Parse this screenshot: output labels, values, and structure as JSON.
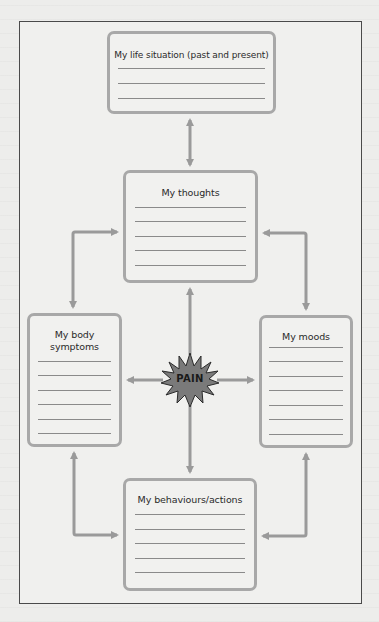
{
  "diagram": {
    "type": "cognitive-behavioural cycle diagram",
    "center": {
      "label": "PAIN",
      "icon": "starburst-icon"
    },
    "boxes": [
      {
        "id": "life-situation",
        "title": "My life situation (past and present)",
        "lines": 3
      },
      {
        "id": "thoughts",
        "title": "My thoughts",
        "lines": 5
      },
      {
        "id": "body-symptoms",
        "title": "My body symptoms",
        "lines": 6
      },
      {
        "id": "moods",
        "title": "My moods",
        "lines": 7
      },
      {
        "id": "behaviours",
        "title": "My behaviours/actions",
        "lines": 5
      }
    ],
    "connections": [
      {
        "from": "life-situation",
        "to": "thoughts",
        "bidirectional": true
      },
      {
        "from": "thoughts",
        "to": "body-symptoms",
        "bidirectional": true
      },
      {
        "from": "thoughts",
        "to": "moods",
        "bidirectional": true
      },
      {
        "from": "body-symptoms",
        "to": "behaviours",
        "bidirectional": true
      },
      {
        "from": "moods",
        "to": "behaviours",
        "bidirectional": true
      },
      {
        "from": "pain",
        "to": "thoughts",
        "bidirectional": false
      },
      {
        "from": "pain",
        "to": "body-symptoms",
        "bidirectional": false
      },
      {
        "from": "pain",
        "to": "moods",
        "bidirectional": false
      },
      {
        "from": "pain",
        "to": "behaviours",
        "bidirectional": false
      }
    ],
    "colors": {
      "box_border": "#a8a8a8",
      "arrow": "#9a9a9a",
      "rule": "#8a8a8a",
      "starburst_fill": "#7a7a7a",
      "frame": "#4a4a4a",
      "background": "#ededeb"
    }
  }
}
